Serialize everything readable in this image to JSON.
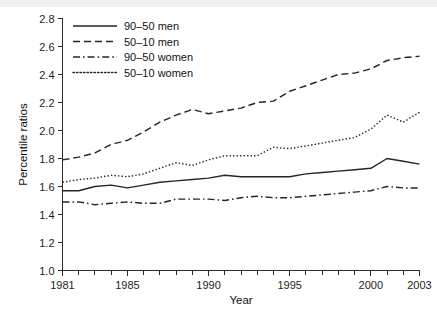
{
  "chart_data": {
    "type": "line",
    "title": "",
    "xlabel": "Year",
    "ylabel": "Percentile ratios",
    "xlim": [
      1981,
      2003
    ],
    "ylim": [
      1.0,
      2.8
    ],
    "yticks": [
      "1.0",
      "1.2",
      "1.4",
      "1.6",
      "1.8",
      "2.0",
      "2.2",
      "2.4",
      "2.6",
      "2.8"
    ],
    "ytick_values": [
      1.0,
      1.2,
      1.4,
      1.6,
      1.8,
      2.0,
      2.2,
      2.4,
      2.6,
      2.8
    ],
    "xticks_labeled": [
      "1981",
      "1985",
      "1990",
      "1995",
      "2000",
      "2003"
    ],
    "xtick_label_values": [
      1981,
      1985,
      1990,
      1995,
      2000,
      2003
    ],
    "x": [
      1981,
      1982,
      1983,
      1984,
      1985,
      1986,
      1987,
      1988,
      1989,
      1990,
      1991,
      1992,
      1993,
      1994,
      1995,
      1996,
      1997,
      1998,
      1999,
      2000,
      2001,
      2002,
      2003
    ],
    "grid": false,
    "legend_position": "top-left",
    "series": [
      {
        "name": "90–50 men",
        "style": "solid",
        "values": [
          1.57,
          1.57,
          1.6,
          1.61,
          1.59,
          1.61,
          1.63,
          1.64,
          1.65,
          1.66,
          1.68,
          1.67,
          1.67,
          1.67,
          1.67,
          1.69,
          1.7,
          1.71,
          1.72,
          1.73,
          1.8,
          1.78,
          1.76
        ]
      },
      {
        "name": "50–10 men",
        "style": "dashed",
        "values": [
          1.79,
          1.81,
          1.84,
          1.9,
          1.93,
          1.99,
          2.06,
          2.11,
          2.15,
          2.12,
          2.14,
          2.16,
          2.2,
          2.21,
          2.28,
          2.32,
          2.36,
          2.4,
          2.41,
          2.44,
          2.5,
          2.52,
          2.53
        ]
      },
      {
        "name": "90–50 women",
        "style": "dashdot",
        "values": [
          1.49,
          1.49,
          1.47,
          1.48,
          1.49,
          1.48,
          1.48,
          1.51,
          1.51,
          1.51,
          1.5,
          1.52,
          1.53,
          1.52,
          1.52,
          1.53,
          1.54,
          1.55,
          1.56,
          1.57,
          1.6,
          1.59,
          1.59
        ]
      },
      {
        "name": "50–10 women",
        "style": "dotted",
        "values": [
          1.63,
          1.65,
          1.66,
          1.68,
          1.67,
          1.69,
          1.73,
          1.77,
          1.75,
          1.79,
          1.82,
          1.82,
          1.82,
          1.88,
          1.87,
          1.89,
          1.91,
          1.93,
          1.95,
          2.01,
          2.11,
          2.06,
          2.13
        ]
      }
    ]
  },
  "axis": {
    "ylabel": "Percentile ratios",
    "xlabel": "Year"
  },
  "legend": {
    "items": [
      {
        "label": "90–50 men"
      },
      {
        "label": "50–10 men"
      },
      {
        "label": "90–50 women"
      },
      {
        "label": "50–10 women"
      }
    ]
  },
  "colors": {
    "line": "#262626",
    "axis": "#2b2b2b",
    "text": "#111111",
    "background": "#ffffff"
  }
}
